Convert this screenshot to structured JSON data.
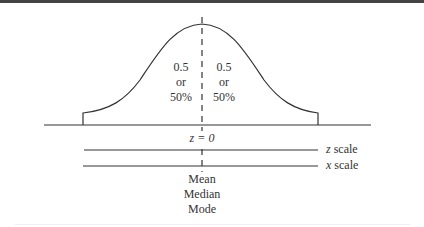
{
  "diagram": {
    "type": "normal-distribution",
    "left_half": {
      "value": "0.5",
      "connector": "or",
      "percent": "50%"
    },
    "right_half": {
      "value": "0.5",
      "connector": "or",
      "percent": "50%"
    },
    "center_label": "z = 0",
    "scales": [
      {
        "var": "z",
        "label": "scale"
      },
      {
        "var": "x",
        "label": "scale"
      }
    ],
    "center_measures": [
      "Mean",
      "Median",
      "Mode"
    ],
    "colors": {
      "line": "#333333",
      "background": "#ffffff"
    }
  }
}
